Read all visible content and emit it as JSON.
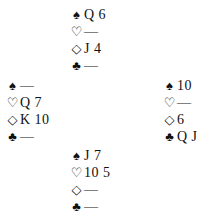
{
  "suits": {
    "spades": "♠",
    "hearts": "♡",
    "diamonds": "◇",
    "clubs": "♣"
  },
  "hands": {
    "north": {
      "spades": "Q 6",
      "hearts": "—",
      "diamonds": "J 4",
      "clubs": "—"
    },
    "west": {
      "spades": "—",
      "hearts": "Q 7",
      "diamonds": "K 10",
      "clubs": "—"
    },
    "east": {
      "spades": "10",
      "hearts": "—",
      "diamonds": "6",
      "clubs": "Q J"
    },
    "south": {
      "spades": "J 7",
      "hearts": "10 5",
      "diamonds": "—",
      "clubs": "—"
    }
  }
}
